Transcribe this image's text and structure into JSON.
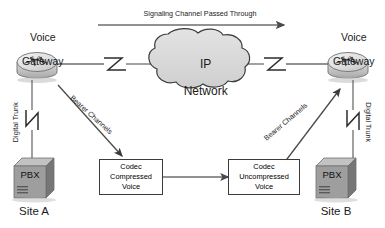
{
  "diagram": {
    "width": 385,
    "height": 228,
    "background": "#ffffff"
  },
  "colors": {
    "line": "#6e6e6e",
    "line_dark": "#3b3b3b",
    "cloud_fill": "#d9d9d9",
    "cloud_stroke": "#3b3b3b",
    "router_body": "#c9c9c9",
    "router_top": "#e4e4e4",
    "pbx_front": "#9a9a9a",
    "pbx_side": "#6f6f6f",
    "pbx_top": "#bdbdbd",
    "text": "#1a1a1a"
  },
  "top_flow": {
    "label": "Signaling Channel Passed Through",
    "direction": "left-to-right",
    "arrow_icon": "arrow-right-icon"
  },
  "network": {
    "cloud_label_line1": "IP",
    "cloud_label_line2": "Network",
    "icon": "cloud-icon"
  },
  "gateways": [
    {
      "id": "left",
      "label_line1": "Voice",
      "label_line2": "Gateway",
      "icon": "router-icon"
    },
    {
      "id": "right",
      "label_line1": "Voice",
      "label_line2": "Gateway",
      "icon": "router-icon"
    }
  ],
  "sites": [
    {
      "id": "site-a",
      "label": "Site A",
      "pbx_label": "PBX",
      "pbx_icon": "pbx-cube-icon",
      "trunk_label": "Digital Trunk",
      "trunk_icon": "serial-link-zigzag-icon"
    },
    {
      "id": "site-b",
      "label": "Site B",
      "pbx_label": "PBX",
      "pbx_icon": "pbx-cube-icon",
      "trunk_label": "Digital Trunk",
      "trunk_icon": "serial-link-zigzag-icon"
    }
  ],
  "codecs": [
    {
      "id": "codec-compressed",
      "line1": "Codec",
      "line2": "Compressed",
      "line3": "Voice"
    },
    {
      "id": "codec-uncompressed",
      "line1": "Codec",
      "line2": "Uncompressed",
      "line3": "Voice"
    }
  ],
  "bearer_links": [
    {
      "id": "bearer-left",
      "label": "Bearer Channels",
      "direction": "gateway-to-codec"
    },
    {
      "id": "bearer-right",
      "label": "Bearer Channels",
      "direction": "codec-to-gateway"
    }
  ],
  "codec_link": {
    "direction": "left-to-right",
    "arrow_icon": "arrow-right-icon"
  }
}
